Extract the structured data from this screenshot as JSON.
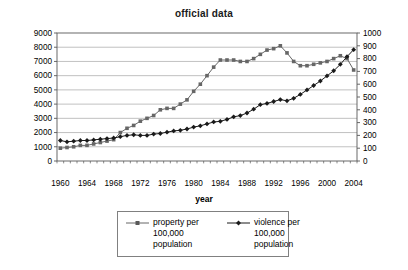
{
  "chart_data": {
    "type": "line",
    "title": "official data",
    "xlabel": "year",
    "grid": true,
    "legend_position": "bottom",
    "x": [
      1960,
      1961,
      1962,
      1963,
      1964,
      1965,
      1966,
      1967,
      1968,
      1969,
      1970,
      1971,
      1972,
      1973,
      1974,
      1975,
      1976,
      1977,
      1978,
      1979,
      1980,
      1981,
      1982,
      1983,
      1984,
      1985,
      1986,
      1987,
      1988,
      1989,
      1990,
      1991,
      1992,
      1993,
      1994,
      1995,
      1996,
      1997,
      1998,
      1999,
      2000,
      2001,
      2002,
      2003,
      2004
    ],
    "x_tick_labels": [
      1960,
      1964,
      1968,
      1972,
      1976,
      1980,
      1984,
      1988,
      1992,
      1996,
      2000,
      2004
    ],
    "left_axis": {
      "min": 0,
      "max": 9000,
      "step": 1000
    },
    "right_axis": {
      "min": 0,
      "max": 1000,
      "step": 100
    },
    "series": [
      {
        "name": "property per 100,000 population",
        "axis": "left",
        "marker": "square",
        "color": "#666666",
        "values": [
          900,
          950,
          1000,
          1100,
          1100,
          1200,
          1300,
          1400,
          1500,
          2000,
          2300,
          2500,
          2800,
          3000,
          3200,
          3600,
          3700,
          3700,
          4000,
          4300,
          4900,
          5400,
          6000,
          6600,
          7100,
          7100,
          7100,
          7000,
          7000,
          7200,
          7500,
          7800,
          7900,
          8100,
          7600,
          7000,
          6700,
          6700,
          6800,
          6900,
          7000,
          7200,
          7400,
          7200,
          6400
        ]
      },
      {
        "name": "violence per 100,000 population",
        "axis": "right",
        "marker": "diamond",
        "color": "#1a1a1a",
        "values": [
          160,
          150,
          155,
          160,
          160,
          165,
          170,
          175,
          180,
          190,
          200,
          205,
          200,
          200,
          210,
          215,
          225,
          235,
          240,
          250,
          265,
          275,
          290,
          305,
          310,
          325,
          345,
          355,
          375,
          405,
          440,
          450,
          465,
          480,
          470,
          490,
          520,
          555,
          590,
          625,
          665,
          705,
          755,
          815,
          870
        ]
      }
    ]
  }
}
